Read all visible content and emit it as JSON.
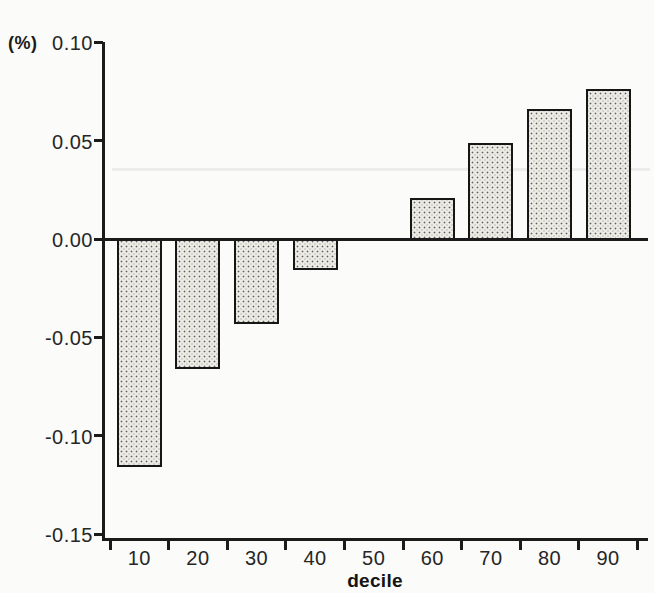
{
  "chart_data": {
    "type": "bar",
    "title": "",
    "ylabel": "(%)",
    "xlabel": "decile",
    "categories": [
      "10",
      "20",
      "30",
      "40",
      "50",
      "60",
      "70",
      "80",
      "90"
    ],
    "values": [
      -0.116,
      -0.066,
      -0.043,
      -0.016,
      0,
      0.021,
      0.049,
      0.066,
      0.076
    ],
    "y_ticks": [
      {
        "label": "0.10",
        "value": 0.1
      },
      {
        "label": "0.05",
        "value": 0.05
      },
      {
        "label": "0.00",
        "value": 0.0
      },
      {
        "label": "-0.05",
        "value": -0.05
      },
      {
        "label": "-0.10",
        "value": -0.1
      },
      {
        "label": "-0.15",
        "value": -0.15
      }
    ],
    "ylim": [
      -0.15,
      0.115
    ],
    "grid": false,
    "legend": "none",
    "bar_fill": "#edebe5",
    "bar_dot_color": "#61605c",
    "bar_border_color": "#161616",
    "axis_color": "#1b1b1b",
    "background": "#fbfbf9"
  }
}
